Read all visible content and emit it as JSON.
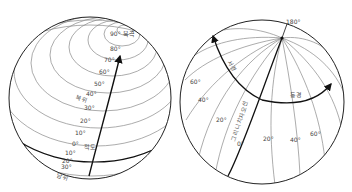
{
  "latitude_globe": {
    "north_pole_label": "90° 북극",
    "north_hemisphere_label": "북위",
    "equator_label": "적도",
    "south_hemisphere_label": "남위",
    "north_ticks": [
      "80°",
      "70°",
      "60°",
      "50°",
      "40°",
      "30°",
      "20°",
      "10°",
      "0°"
    ],
    "south_ticks": [
      "10°",
      "20°",
      "30°"
    ]
  },
  "longitude_globe": {
    "top_label": "180°",
    "west_label": "서경",
    "east_label": "동경",
    "prime_meridian_label": "그리니치자오선",
    "west_ticks": [
      "60°",
      "40°",
      "20°"
    ],
    "zero_tick": "0°",
    "east_ticks": [
      "20°",
      "40°",
      "60°"
    ]
  }
}
